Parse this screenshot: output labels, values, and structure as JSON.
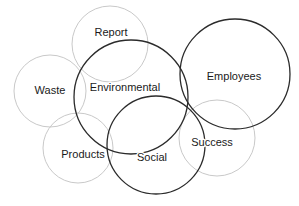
{
  "diagram": {
    "type": "venn-bubble",
    "width": 299,
    "height": 206,
    "background_color": "#ffffff",
    "stroke_colors": {
      "primary": "#2b2b2b",
      "secondary": "#c9c9c9"
    },
    "label_color": "#1a1a1a",
    "circles": [
      {
        "id": "waste",
        "label": "Waste",
        "cx": 50,
        "cy": 91,
        "r": 36,
        "emphasis": "secondary",
        "stroke": "#c9c9c9",
        "stroke_width": 1,
        "label_x": 50,
        "label_y": 91
      },
      {
        "id": "report",
        "label": "Report",
        "cx": 110,
        "cy": 44,
        "r": 38,
        "emphasis": "secondary",
        "stroke": "#c9c9c9",
        "stroke_width": 1,
        "label_x": 111,
        "label_y": 33
      },
      {
        "id": "products",
        "label": "Products",
        "cx": 78,
        "cy": 148,
        "r": 35,
        "emphasis": "secondary",
        "stroke": "#c9c9c9",
        "stroke_width": 1,
        "label_x": 83,
        "label_y": 155
      },
      {
        "id": "success",
        "label": "Success",
        "cx": 217,
        "cy": 138,
        "r": 38,
        "emphasis": "secondary",
        "stroke": "#c9c9c9",
        "stroke_width": 1,
        "label_x": 212,
        "label_y": 143
      },
      {
        "id": "environmental",
        "label": "Environmental",
        "cx": 131,
        "cy": 97,
        "r": 57,
        "emphasis": "primary",
        "stroke": "#2b2b2b",
        "stroke_width": 1.3,
        "label_x": 125,
        "label_y": 88
      },
      {
        "id": "employees",
        "label": "Employees",
        "cx": 235,
        "cy": 74,
        "r": 55,
        "emphasis": "primary",
        "stroke": "#2b2b2b",
        "stroke_width": 1.3,
        "label_x": 234,
        "label_y": 77
      },
      {
        "id": "social",
        "label": "Social",
        "cx": 156,
        "cy": 145,
        "r": 49,
        "emphasis": "primary",
        "stroke": "#2b2b2b",
        "stroke_width": 1.3,
        "label_x": 152,
        "label_y": 158
      }
    ]
  }
}
